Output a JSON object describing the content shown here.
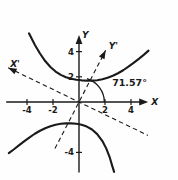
{
  "figure": {
    "background_color": "#fefefe",
    "ink_color": "#1a1a1a"
  },
  "chart_data": {
    "type": "line",
    "title": "",
    "subtitle": "",
    "xlabel": "X",
    "ylabel": "Y",
    "xlim": [
      -5.6,
      5.4
    ],
    "ylim": [
      -5.6,
      5.4
    ],
    "grid": false,
    "legend": "none",
    "axes": {
      "primary": {
        "x_axis_label": "X",
        "y_axis_label": "Y",
        "x_ticks": [
          -4,
          -2,
          2,
          4
        ],
        "x_tick_labels": [
          "-4",
          "-2",
          "2",
          "4"
        ],
        "y_ticks": [
          2,
          4,
          -4
        ],
        "y_tick_labels": [
          "2",
          "4",
          "-4"
        ],
        "style": "solid-with-arrowheads"
      },
      "rotated": {
        "x_axis_label": "X'",
        "y_axis_label": "Y'",
        "style": "dashed-with-arrowheads",
        "rotation_degrees": 71.57,
        "x_prime_slope": -0.5,
        "y_prime_slope": 2.0
      }
    },
    "annotations": [
      {
        "name": "rotation-angle",
        "text": "71.57°",
        "x": 2.55,
        "y": 1.25,
        "arc_from_degrees": 0,
        "arc_to_degrees": 71.57,
        "arc_radius_units": 1.95
      }
    ],
    "series": [
      {
        "name": "hyperbola-upper-branch",
        "style": "solid",
        "points": [
          [
            -3.85,
            5.45
          ],
          [
            -3.4,
            4.55
          ],
          [
            -3.0,
            3.85
          ],
          [
            -2.6,
            3.25
          ],
          [
            -2.2,
            2.78
          ],
          [
            -1.8,
            2.42
          ],
          [
            -1.4,
            2.15
          ],
          [
            -1.0,
            1.97
          ],
          [
            -0.6,
            1.84
          ],
          [
            -0.2,
            1.76
          ],
          [
            0.2,
            1.72
          ],
          [
            0.6,
            1.7
          ],
          [
            1.0,
            1.7
          ],
          [
            1.4,
            1.73
          ],
          [
            1.8,
            1.8
          ],
          [
            2.2,
            1.92
          ],
          [
            2.6,
            2.08
          ],
          [
            3.0,
            2.28
          ],
          [
            3.4,
            2.52
          ],
          [
            3.8,
            2.8
          ],
          [
            4.2,
            3.1
          ],
          [
            4.6,
            3.42
          ],
          [
            5.0,
            3.76
          ],
          [
            5.35,
            4.08
          ]
        ]
      },
      {
        "name": "hyperbola-lower-branch",
        "style": "solid",
        "points": [
          [
            -5.4,
            -4.05
          ],
          [
            -5.0,
            -3.75
          ],
          [
            -4.6,
            -3.42
          ],
          [
            -4.2,
            -3.1
          ],
          [
            -3.8,
            -2.8
          ],
          [
            -3.4,
            -2.52
          ],
          [
            -3.0,
            -2.28
          ],
          [
            -2.6,
            -2.08
          ],
          [
            -2.2,
            -1.92
          ],
          [
            -1.8,
            -1.8
          ],
          [
            -1.4,
            -1.73
          ],
          [
            -1.0,
            -1.7
          ],
          [
            -0.6,
            -1.7
          ],
          [
            -0.2,
            -1.73
          ],
          [
            0.2,
            -1.8
          ],
          [
            0.6,
            -1.95
          ],
          [
            1.0,
            -2.18
          ],
          [
            1.4,
            -2.55
          ],
          [
            1.8,
            -3.1
          ],
          [
            2.1,
            -3.7
          ],
          [
            2.35,
            -4.35
          ],
          [
            2.55,
            -5.05
          ],
          [
            2.7,
            -5.55
          ]
        ]
      }
    ],
    "dashed_lines": [
      {
        "name": "x-prime-axis",
        "from": [
          -5.45,
          2.72
        ],
        "to": [
          5.3,
          -2.65
        ],
        "arrow_at": "start"
      },
      {
        "name": "y-prime-axis",
        "from": [
          -1.85,
          -3.7
        ],
        "to": [
          2.05,
          4.1
        ],
        "arrow_at": "end"
      }
    ]
  }
}
